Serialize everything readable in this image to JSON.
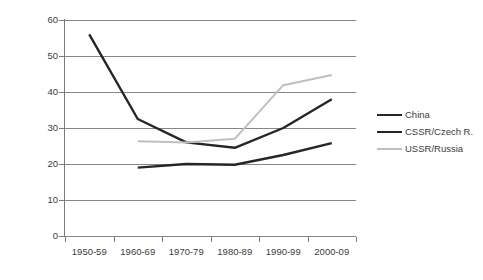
{
  "chart_data": {
    "type": "line",
    "title": "",
    "xlabel": "",
    "ylabel": "",
    "categories": [
      "1950-59",
      "1960-69",
      "1970-79",
      "1980-89",
      "1990-99",
      "2000-09"
    ],
    "ylim": [
      0,
      60
    ],
    "yticks": [
      0,
      10,
      20,
      30,
      40,
      50,
      60
    ],
    "ytick_labels": [
      "0",
      "10",
      "20",
      "30",
      "40",
      "50",
      "60"
    ],
    "grid": true,
    "legend_position": "right",
    "series": [
      {
        "name": "China",
        "color": "#262626",
        "width": 2.4,
        "values": [
          null,
          19.0,
          20.0,
          19.8,
          22.5,
          25.8
        ]
      },
      {
        "name": "CSSR/Czech R.",
        "color": "#262626",
        "width": 2.4,
        "values": [
          56.0,
          32.5,
          26.0,
          24.5,
          30.0,
          38.0
        ]
      },
      {
        "name": "USSR/Russia",
        "color": "#bfbfbf",
        "width": 2.0,
        "values": [
          null,
          26.3,
          26.0,
          27.0,
          41.9,
          44.7
        ]
      }
    ]
  },
  "legend": {
    "items": [
      {
        "label": "China",
        "color": "#262626",
        "width": 2.4
      },
      {
        "label": "CSSR/Czech R.",
        "color": "#262626",
        "width": 2.4
      },
      {
        "label": "USSR/Russia",
        "color": "#bfbfbf",
        "width": 2.0
      }
    ]
  },
  "axes": {
    "grid_color": "#868686",
    "axis_color": "#7a7a7a",
    "label_color": "#3c3c3c"
  }
}
